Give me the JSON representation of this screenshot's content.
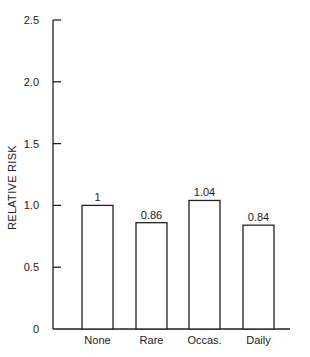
{
  "chart_data": {
    "type": "bar",
    "title": "",
    "xlabel": "",
    "ylabel": "RELATIVE RISK",
    "categories": [
      "None",
      "Rare",
      "Occas.",
      "Daily"
    ],
    "values": [
      1,
      0.86,
      1.04,
      0.84
    ],
    "value_labels": [
      "1",
      "0.86",
      "1.04",
      "0.84"
    ],
    "ylim": [
      0,
      2.5
    ],
    "yticks": [
      0,
      0.5,
      1.0,
      1.5,
      2.0,
      2.5
    ],
    "ytick_labels": [
      "0",
      "0.5",
      "1.0",
      "1.5",
      "2.0",
      "2.5"
    ],
    "grid": false,
    "legend": null,
    "bar_fill": "#ffffff",
    "bar_stroke": "#222222"
  }
}
